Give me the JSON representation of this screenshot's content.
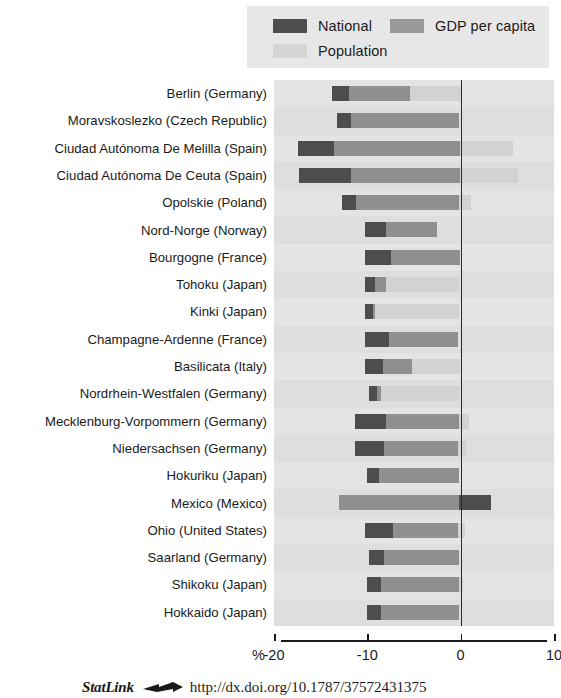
{
  "legend": {
    "items": [
      {
        "label": "National",
        "color": "#4d4d4d",
        "key": "national"
      },
      {
        "label": "GDP per capita",
        "color": "#9a9a9a",
        "key": "gdp"
      },
      {
        "label": "Population",
        "color": "#d2d2d2",
        "key": "population"
      }
    ]
  },
  "axis": {
    "percent_symbol": "%",
    "ticks": [
      {
        "value": -20,
        "label": "-20"
      },
      {
        "value": -10,
        "label": "-10"
      },
      {
        "value": 0,
        "label": "0"
      },
      {
        "value": 10,
        "label": "10"
      }
    ],
    "xlim": [
      -20,
      10
    ]
  },
  "footer": {
    "statlink_word": "StatLink",
    "statlink_icon": "statlink-arrow-icon",
    "url": "http://dx.doi.org/10.1787/37572431375"
  },
  "chart_data": {
    "type": "bar",
    "orientation": "horizontal",
    "title": "",
    "xlabel": "%",
    "ylabel": "",
    "xlim": [
      -20,
      10
    ],
    "grid": false,
    "legend_position": "top",
    "series": [
      {
        "name": "National",
        "color": "#4d4d4d"
      },
      {
        "name": "GDP per capita",
        "color": "#9a9a9a"
      },
      {
        "name": "Population",
        "color": "#d2d2d2"
      }
    ],
    "categories": [
      "Berlin (Germany)",
      "Moravskoslezko (Czech Republic)",
      "Ciudad Autónoma De Melilla  (Spain)",
      "Ciudad Autónoma De Ceuta (Spain)",
      "Opolskie (Poland)",
      "Nord-Norge (Norway)",
      "Bourgogne (France)",
      "Tohoku (Japan)",
      "Kinki (Japan)",
      "Champagne-Ardenne (France)",
      "Basilicata (Italy)",
      "Nordrhein-Westfalen (Germany)",
      "Mecklenburg-Vorpommern (Germany)",
      "Niedersachsen (Germany)",
      "Hokuriku (Japan)",
      "Mexico (Mexico)",
      "Ohio (United States)",
      "Saarland (Germany)",
      "Shikoku (Japan)",
      "Hokkaido (Japan)"
    ],
    "rows": [
      {
        "category": "Berlin (Germany)",
        "national_start": -13.8,
        "national_end": -12.0,
        "gdp_end": -5.4,
        "population_end": 0.0
      },
      {
        "category": "Moravskoslezko (Czech Republic)",
        "national_start": -13.2,
        "national_end": -11.7,
        "gdp_end": -0.2,
        "population_end": -0.2
      },
      {
        "category": "Ciudad Autónoma De Melilla  (Spain)",
        "national_start": -17.4,
        "national_end": -13.6,
        "gdp_end": -0.1,
        "population_end": 5.6
      },
      {
        "category": "Ciudad Autónoma De Ceuta (Spain)",
        "national_start": -17.3,
        "national_end": -11.8,
        "gdp_end": -0.1,
        "population_end": 6.1
      },
      {
        "category": "Opolskie (Poland)",
        "national_start": -12.7,
        "national_end": -11.2,
        "gdp_end": -0.2,
        "population_end": 1.1
      },
      {
        "category": "Nord-Norge (Norway)",
        "national_start": -10.3,
        "national_end": -8.0,
        "gdp_end": -2.5,
        "population_end": -2.5
      },
      {
        "category": "Bourgogne (France)",
        "national_start": -10.2,
        "national_end": -7.5,
        "gdp_end": -0.1,
        "population_end": -0.1
      },
      {
        "category": "Tohoku (Japan)",
        "national_start": -10.3,
        "national_end": -9.2,
        "gdp_end": -8.0,
        "population_end": -0.2
      },
      {
        "category": "Kinki (Japan)",
        "national_start": -10.2,
        "national_end": -9.4,
        "gdp_end": -9.2,
        "population_end": -0.2
      },
      {
        "category": "Champagne-Ardenne (France)",
        "national_start": -10.2,
        "national_end": -7.7,
        "gdp_end": -0.3,
        "population_end": -0.3
      },
      {
        "category": "Basilicata (Italy)",
        "national_start": -10.2,
        "national_end": -8.3,
        "gdp_end": -5.2,
        "population_end": -0.1
      },
      {
        "category": "Nordrhein-Westfalen (Germany)",
        "national_start": -9.8,
        "national_end": -9.0,
        "gdp_end": -8.5,
        "population_end": -0.1
      },
      {
        "category": "Mecklenburg-Vorpommern (Germany)",
        "national_start": -11.3,
        "national_end": -8.0,
        "gdp_end": -0.2,
        "population_end": 0.9
      },
      {
        "category": "Niedersachsen (Germany)",
        "national_start": -11.3,
        "national_end": -8.2,
        "gdp_end": -0.3,
        "population_end": 0.6
      },
      {
        "category": "Hokuriku (Japan)",
        "national_start": -10.0,
        "national_end": -8.7,
        "gdp_end": -0.2,
        "population_end": -0.2
      },
      {
        "category": "Mexico (Mexico)",
        "national_start": -0.2,
        "national_end": 3.2,
        "gdp_end": -0.2,
        "population_end": -0.2,
        "gdp_start": -13.0
      },
      {
        "category": "Ohio (United States)",
        "national_start": -10.3,
        "national_end": -7.2,
        "gdp_end": -0.3,
        "population_end": 0.5
      },
      {
        "category": "Saarland (Germany)",
        "national_start": -9.8,
        "national_end": -8.2,
        "gdp_end": -0.2,
        "population_end": -0.2
      },
      {
        "category": "Shikoku (Japan)",
        "national_start": -10.0,
        "national_end": -8.5,
        "gdp_end": -0.2,
        "population_end": 0.2
      },
      {
        "category": "Hokkaido (Japan)",
        "national_start": -10.0,
        "national_end": -8.5,
        "gdp_end": -0.2,
        "population_end": -0.2
      }
    ]
  }
}
